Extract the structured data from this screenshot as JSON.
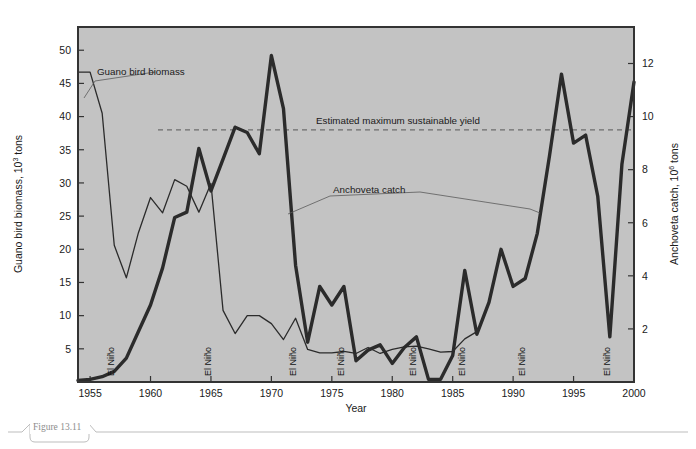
{
  "figure": {
    "caption": "Figure 13.11",
    "plot_bg": "#c3c3c3",
    "frame_color": "#333333",
    "page_bg": "#ffffff",
    "caption_rule_color": "#bdbdbd"
  },
  "axes": {
    "x": {
      "label": "Year",
      "min": 1954,
      "max": 2000,
      "ticks": [
        1955,
        1960,
        1965,
        1970,
        1975,
        1980,
        1985,
        1990,
        1995,
        2000
      ],
      "tick_labels": [
        "1955",
        "1960",
        "1965",
        "1970",
        "1975",
        "1980",
        "1985",
        "1990",
        "1995",
        "2000"
      ]
    },
    "y_left": {
      "label_main": "Guano bird biomass, 10",
      "label_exp": "3",
      "label_tail": " tons",
      "label_full": "Guano bird biomass, 10³ tons",
      "min": 0,
      "max": 53.5,
      "ticks": [
        5,
        10,
        15,
        20,
        25,
        30,
        35,
        40,
        45,
        50
      ],
      "tick_labels": [
        "5",
        "10",
        "15",
        "20",
        "25",
        "30",
        "35",
        "40",
        "45",
        "50"
      ]
    },
    "y_right": {
      "label_main": "Anchoveta catch, 10",
      "label_exp": "6",
      "label_tail": " tons",
      "label_full": "Anchoveta catch, 10⁶ tons",
      "min": 0,
      "max": 13.375,
      "ticks": [
        2,
        4,
        6,
        8,
        10,
        12
      ],
      "tick_labels": [
        "2",
        "4",
        "6",
        "8",
        "10",
        "12"
      ]
    }
  },
  "annotations": {
    "guano": {
      "text": "Guano bird biomass",
      "x": 97,
      "y": 75
    },
    "anchoveta": {
      "text": "Anchoveta catch",
      "x": 333,
      "y": 193
    },
    "msy": {
      "text": "Estimated maximum sustainable yield",
      "x": 316,
      "y": 124
    },
    "el_nino_label": "El Niño",
    "el_nino_years": [
      1957,
      1965,
      1972,
      1976,
      1982,
      1986,
      1991,
      1998
    ]
  },
  "msy_line": {
    "value_right_axis": 9.5,
    "style": "dashed",
    "color": "#6d6d6d"
  },
  "chart_data": {
    "type": "line",
    "xlabel": "Year",
    "grid": false,
    "legend": "inline-annotations",
    "xlim": [
      1954,
      2000
    ],
    "series": [
      {
        "name": "Guano bird biomass",
        "axis": "left",
        "unit": "10^3 tons",
        "ylim": [
          0,
          53.5
        ],
        "color": "#2b2b2b",
        "linewidth": 1.3,
        "x": [
          1954,
          1955,
          1956,
          1957,
          1958,
          1959,
          1960,
          1961,
          1962,
          1963,
          1964,
          1965,
          1966,
          1967,
          1968,
          1969,
          1970,
          1971,
          1972,
          1973,
          1974,
          1975,
          1976,
          1977,
          1978,
          1979,
          1980,
          1981,
          1982,
          1983,
          1984,
          1985,
          1986,
          1987
        ],
        "y": [
          46.7,
          46.7,
          40.5,
          20.6,
          15.7,
          22.5,
          27.8,
          25.5,
          30.5,
          29.5,
          25.6,
          29.9,
          10.8,
          7.3,
          10.0,
          10.0,
          8.8,
          6.4,
          9.6,
          4.9,
          4.4,
          4.4,
          4.6,
          4.3,
          5.2,
          4.3,
          4.9,
          5.3,
          5.4,
          5.0,
          4.5,
          4.6,
          6.5,
          7.6
        ]
      },
      {
        "name": "Anchoveta catch",
        "axis": "right",
        "unit": "10^6 tons",
        "ylim": [
          0,
          13.375
        ],
        "color": "#2b2b2b",
        "linewidth": 3.4,
        "x": [
          1954,
          1955,
          1956,
          1957,
          1958,
          1959,
          1960,
          1961,
          1962,
          1963,
          1964,
          1965,
          1966,
          1967,
          1968,
          1969,
          1970,
          1971,
          1972,
          1973,
          1974,
          1975,
          1976,
          1977,
          1978,
          1979,
          1980,
          1981,
          1982,
          1983,
          1984,
          1985,
          1986,
          1987,
          1988,
          1989,
          1990,
          1991,
          1992,
          1993,
          1994,
          1995,
          1996,
          1997,
          1998,
          1999,
          2000
        ],
        "y": [
          0.06,
          0.1,
          0.2,
          0.4,
          0.9,
          1.9,
          2.9,
          4.3,
          6.2,
          6.4,
          8.8,
          7.2,
          8.4,
          9.6,
          9.4,
          8.6,
          12.3,
          10.3,
          4.4,
          1.5,
          3.6,
          2.9,
          3.6,
          0.8,
          1.2,
          1.4,
          0.7,
          1.3,
          1.7,
          0.1,
          0.1,
          1.0,
          4.2,
          1.8,
          3.0,
          5.0,
          3.6,
          3.9,
          5.6,
          8.5,
          11.6,
          9.0,
          9.3,
          7.0,
          1.7,
          8.2,
          11.3
        ]
      }
    ]
  }
}
